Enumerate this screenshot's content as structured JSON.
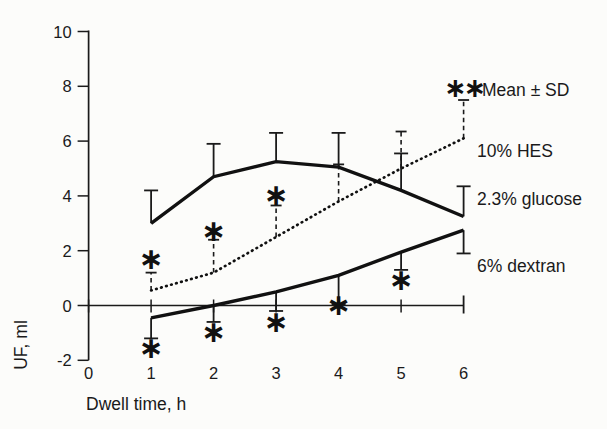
{
  "figure": {
    "background": "#fcfcfa",
    "ink": "#1a1a1a"
  },
  "legend": {
    "mean_sd_label": "Mean ± SD",
    "single_sig_mark": "∗",
    "double_sig_mark": "∗∗"
  },
  "chart_data": {
    "type": "line",
    "title": "",
    "xlabel": "Dwell time, h",
    "ylabel": "UF, ml",
    "xlim": [
      0,
      6
    ],
    "ylim": [
      -2,
      10
    ],
    "x_ticks": [
      0,
      1,
      2,
      3,
      4,
      5,
      6
    ],
    "y_ticks": [
      10,
      8,
      6,
      4,
      2,
      0,
      -2
    ],
    "grid": false,
    "legend_position": "right",
    "error_bars": "Mean ± SD, SD drawn one-sided",
    "x": [
      1,
      2,
      3,
      4,
      5,
      6
    ],
    "series": [
      {
        "name": "10% HES",
        "line_style": "dotted",
        "error_style": "dashed",
        "values": [
          0.55,
          1.2,
          2.5,
          3.8,
          5.0,
          6.1
        ],
        "sd_upper": [
          1.2,
          2.4,
          3.65,
          5.15,
          6.35,
          7.5
        ],
        "significance": [
          {
            "x": 1,
            "y": 1.7,
            "marks": "∗"
          },
          {
            "x": 2,
            "y": 2.75,
            "marks": "∗"
          },
          {
            "x": 3,
            "y": 4.05,
            "marks": "∗"
          },
          {
            "x": 6,
            "y": 7.95,
            "marks": "∗∗"
          }
        ]
      },
      {
        "name": "2.3% glucose",
        "line_style": "solid",
        "error_style": "solid",
        "values": [
          3.0,
          4.7,
          5.25,
          5.05,
          4.2,
          3.25
        ],
        "sd_upper": [
          4.2,
          5.9,
          6.3,
          6.3,
          5.55,
          4.35
        ],
        "significance": []
      },
      {
        "name": "6% dextran",
        "line_style": "solid",
        "error_style": "solid",
        "values": [
          -0.45,
          0.0,
          0.5,
          1.1,
          1.95,
          2.75
        ],
        "sd_lower": [
          -1.2,
          -0.6,
          -0.2,
          0.05,
          1.3,
          1.9
        ],
        "significance": [
          {
            "x": 1,
            "y": -1.55,
            "marks": "∗"
          },
          {
            "x": 2,
            "y": -0.95,
            "marks": "∗"
          },
          {
            "x": 3,
            "y": -0.6,
            "marks": "∗"
          },
          {
            "x": 4,
            "y": 0.05,
            "marks": "∗"
          },
          {
            "x": 5,
            "y": 0.95,
            "marks": "∗"
          }
        ]
      }
    ]
  }
}
